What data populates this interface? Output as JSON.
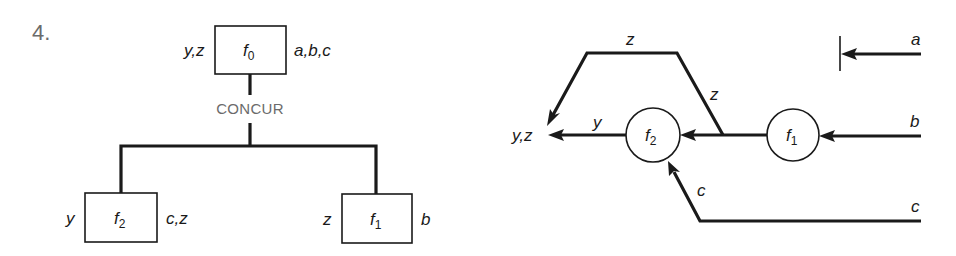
{
  "figure_number": "4.",
  "tree": {
    "connector_label": "CONCUR",
    "root": {
      "name": "f",
      "sub": "0",
      "outputs": "y,z",
      "inputs": "a,b,c"
    },
    "left_child": {
      "name": "f",
      "sub": "2",
      "outputs": "y",
      "inputs": "c,z"
    },
    "right_child": {
      "name": "f",
      "sub": "1",
      "outputs": "z",
      "inputs": "b"
    }
  },
  "dataflow": {
    "output_label": "y,z",
    "nodes": [
      {
        "id": "f2",
        "name": "f",
        "sub": "2"
      },
      {
        "id": "f1",
        "name": "f",
        "sub": "1"
      }
    ],
    "edges": {
      "y_label": "y",
      "z_top_label": "z",
      "z_diag_label": "z",
      "c_diag_label": "c",
      "a_label": "a",
      "b_label": "b",
      "c_label": "c"
    }
  }
}
